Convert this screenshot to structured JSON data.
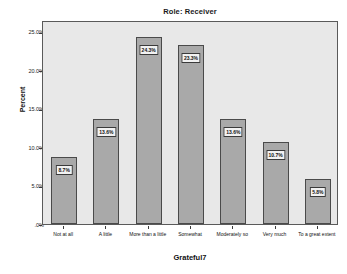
{
  "chart_data": {
    "type": "bar",
    "title": "Role: Receiver",
    "xlabel": "Grateful7",
    "ylabel": "Percent",
    "categories": [
      "Not at all",
      "A little",
      "More than a little",
      "Somewhat",
      "Moderately so",
      "Very much",
      "To a great extent"
    ],
    "values": [
      8.7,
      13.6,
      24.3,
      23.3,
      13.6,
      10.7,
      5.8
    ],
    "data_labels": [
      "8.7%",
      "13.6%",
      "24.3%",
      "23.3%",
      "13.6%",
      "10.7%",
      "5.8%"
    ],
    "ylim": [
      0,
      26.5
    ],
    "yticks": [
      0,
      5,
      10,
      15,
      20,
      25
    ],
    "ytick_labels": [
      ".0%",
      "5.0%",
      "10.0%",
      "15.0%",
      "20.0%",
      "25.0%"
    ],
    "grid": false,
    "legend": "none",
    "colors": {
      "bar_fill": "#a9a9a9",
      "bar_border": "#4a4a4a",
      "plot_background": "#e8e8e8",
      "frame": "#5a5a5a",
      "label_box_fill": "#f2f2f2",
      "text": "#111111"
    }
  }
}
